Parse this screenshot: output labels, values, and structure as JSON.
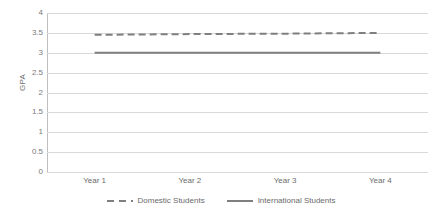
{
  "chart_data": {
    "type": "line",
    "title": "",
    "xlabel": "",
    "ylabel": "GPA",
    "categories": [
      "Year 1",
      "Year 2",
      "Year 3",
      "Year 4"
    ],
    "ylim": [
      0,
      4
    ],
    "y_ticks": [
      "4",
      "3.5",
      "3",
      "2.5",
      "2",
      "1.5",
      "1",
      "0.5",
      "0"
    ],
    "y_tick_values": [
      4,
      3.5,
      3,
      2.5,
      2,
      1.5,
      1,
      0.5,
      0
    ],
    "grid": true,
    "legend_position": "bottom",
    "series": [
      {
        "name": "Domestic Students",
        "values": [
          3.45,
          3.47,
          3.48,
          3.5
        ],
        "style": "dashed",
        "color": "#7f7f7f"
      },
      {
        "name": "International Students",
        "values": [
          3.0,
          3.0,
          3.0,
          3.0
        ],
        "style": "solid",
        "color": "#7f7f7f"
      }
    ]
  },
  "axis": {
    "y_title": "GPA"
  },
  "legend": {
    "items": [
      {
        "label": "Domestic Students",
        "style": "dashed"
      },
      {
        "label": "International Students",
        "style": "solid"
      }
    ]
  },
  "colors": {
    "gridline": "#d9d9d9",
    "axis": "#bfbfbf",
    "series_dashed": "#7f7f7f",
    "series_solid": "#7f7f7f",
    "tick_text": "#6b6b6b",
    "background": "#ffffff"
  }
}
